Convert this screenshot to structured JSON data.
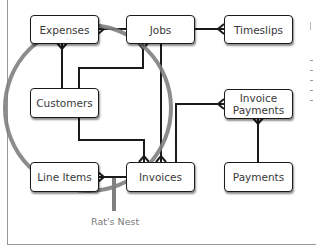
{
  "diagram": {
    "entities": [
      {
        "id": "expenses",
        "label": "Expenses"
      },
      {
        "id": "jobs",
        "label": "Jobs"
      },
      {
        "id": "timeslips",
        "label": "Timeslips"
      },
      {
        "id": "customers",
        "label": "Customers"
      },
      {
        "id": "invoice_payments",
        "label_line1": "Invoice",
        "label_line2": "Payments"
      },
      {
        "id": "line_items",
        "label": "Line Items"
      },
      {
        "id": "invoices",
        "label": "Invoices"
      },
      {
        "id": "payments",
        "label": "Payments"
      }
    ],
    "relationships": [
      {
        "from": "jobs",
        "to": "expenses",
        "type": "one-to-many"
      },
      {
        "from": "jobs",
        "to": "timeslips",
        "type": "one-to-many"
      },
      {
        "from": "customers",
        "to": "expenses",
        "type": "one-to-many"
      },
      {
        "from": "customers",
        "to": "jobs",
        "type": "one-to-many"
      },
      {
        "from": "customers",
        "to": "invoices",
        "type": "one-to-many"
      },
      {
        "from": "jobs",
        "to": "invoices",
        "type": "one-to-many"
      },
      {
        "from": "invoices",
        "to": "line_items",
        "type": "one-to-many"
      },
      {
        "from": "invoices",
        "to": "invoice_payments",
        "type": "one-to-many"
      },
      {
        "from": "payments",
        "to": "invoice_payments",
        "type": "one-to-many"
      }
    ],
    "annotation": {
      "label": "Rat's Nest",
      "circle_color": "#808080"
    },
    "colors": {
      "line": "#1a1a1a",
      "box_border": "#1a1a1a",
      "text": "#3a3a3a",
      "annotation": "#7a7a7a"
    }
  }
}
